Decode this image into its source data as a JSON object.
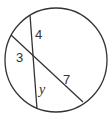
{
  "diagram": {
    "type": "intersecting-chords",
    "stroke_color": "#333333",
    "circle": {
      "cx": 56,
      "cy": 60,
      "rx": 51,
      "ry": 52
    },
    "chords": [
      {
        "name": "chord-vertical",
        "x1": 30,
        "y1": 15,
        "x2": 37,
        "y2": 109
      },
      {
        "name": "chord-diagonal",
        "x1": 11,
        "y1": 35,
        "x2": 83,
        "y2": 102
      }
    ],
    "segment_labels": {
      "top": "4",
      "left": "3",
      "bottom": "y",
      "right": "7"
    }
  }
}
